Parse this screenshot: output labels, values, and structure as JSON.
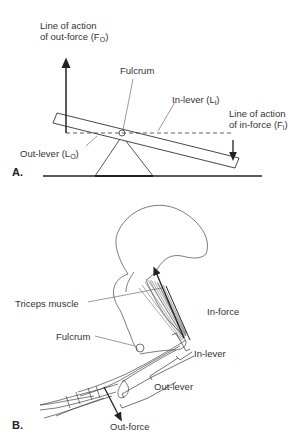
{
  "panel_a": {
    "label": "A.",
    "out_force_line": {
      "text": "Line of action",
      "text2": "of out-force (F",
      "sub": "O",
      "close": ")"
    },
    "fulcrum": "Fulcrum",
    "in_lever": {
      "text": "In-lever (L",
      "sub": "i",
      "close": ")"
    },
    "in_force_line": {
      "text": "Line of action",
      "text2": "of in-force (F",
      "sub": "i",
      "close": ")"
    },
    "out_lever": {
      "text": "Out-lever (L",
      "sub": "O",
      "close": ")"
    }
  },
  "panel_b": {
    "label": "B.",
    "triceps": "Triceps muscle",
    "fulcrum": "Fulcrum",
    "in_force": "In-force",
    "in_lever": "In-lever",
    "out_lever": "Out-lever",
    "out_force": "Out-force"
  },
  "colors": {
    "line": "#2a2a2a",
    "background": "#ffffff"
  }
}
